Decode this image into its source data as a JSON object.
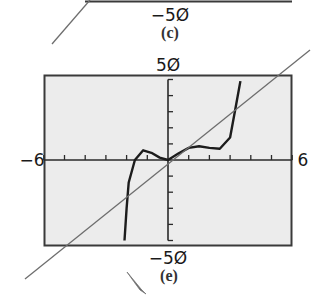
{
  "top_panel": {
    "ymin_label": "−5Ø",
    "caption": "(c)"
  },
  "bottom_panel": {
    "caption": "(e)",
    "ymax_label": "5Ø",
    "ymin_label": "−5Ø",
    "xmin_label": "−6",
    "xmax_label": "6"
  },
  "colors": {
    "plot_bg": "#ececec",
    "frame": "#3a3a3a",
    "curve": "#1c1c1c",
    "line": "#6e6e6e"
  },
  "chart_data": {
    "type": "line",
    "title": "(e)",
    "xlabel": "",
    "ylabel": "",
    "xlim": [
      -6,
      6
    ],
    "ylim": [
      -50,
      50
    ],
    "x_tick_step": 1,
    "y_tick_step": 10,
    "grid": false,
    "tick_labels": {
      "xmin": "−6",
      "xmax": "6",
      "ymin": "−5Ø",
      "ymax": "5Ø"
    },
    "series": [
      {
        "name": "polynomial curve",
        "style": "thick dark",
        "x": [
          -2.1,
          -2.0,
          -1.9,
          -1.6,
          -1.2,
          -0.8,
          -0.4,
          0,
          0.5,
          1.0,
          1.5,
          2.0,
          2.5,
          3.0,
          3.3,
          3.5
        ],
        "y": [
          -50,
          -30,
          -14,
          0,
          6,
          4.5,
          1.5,
          0,
          4,
          7.5,
          8.5,
          7.5,
          7,
          14,
          35,
          49
        ]
      },
      {
        "name": "straight line",
        "style": "thin gray",
        "x": [
          -7,
          7
        ],
        "y": [
          -58,
          57
        ]
      }
    ]
  }
}
